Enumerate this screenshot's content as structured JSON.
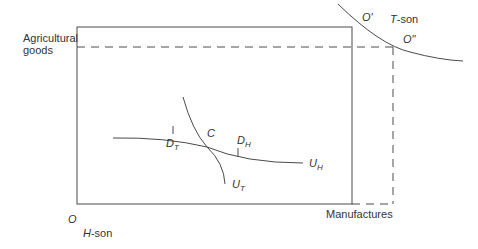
{
  "diagram": {
    "type": "edgeworth-box",
    "axis_labels": {
      "vertical": "Agricultural goods",
      "vertical_line1": "Agricultural",
      "vertical_line2": "goods",
      "horizontal": "Manufactures"
    },
    "origins": {
      "home": "O",
      "home_label": "H-son",
      "home_letter": "H",
      "home_suffix": "-son",
      "trade_origin": "O'",
      "trade_origin_shifted": "O\"",
      "trade_label": "T-son",
      "trade_letter": "T",
      "trade_suffix": "-son"
    },
    "points": {
      "contract": "C",
      "d_t": {
        "main": "D",
        "sub": "T"
      },
      "d_h": {
        "main": "D",
        "sub": "H"
      }
    },
    "curves": {
      "u_h": {
        "main": "U",
        "sub": "H"
      },
      "u_t": {
        "main": "U",
        "sub": "T"
      }
    },
    "colors": {
      "line": "#4a4a4a",
      "text": "#333333",
      "background": "#ffffff"
    }
  }
}
